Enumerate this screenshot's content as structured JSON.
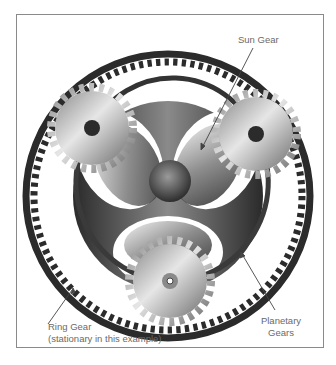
{
  "diagram": {
    "labels": {
      "sun_gear": "Sun Gear",
      "ring_gear_line1": "Ring Gear",
      "ring_gear_line2": "(stationary in this example)",
      "planetary_line1": "Planetary",
      "planetary_line2": "Gears"
    },
    "components": [
      {
        "name": "ring-gear",
        "role": "outer internal-toothed gear",
        "state": "stationary"
      },
      {
        "name": "carrier",
        "role": "tri-lobed carrier plate linking planet centres"
      },
      {
        "name": "sun-gear",
        "role": "central gear"
      },
      {
        "name": "planet-gear",
        "count": 3
      }
    ],
    "colors": {
      "ring": "#2b2b2b",
      "carrier": "#3a3a3a",
      "planet_light": "#d9d9d9",
      "planet_dark": "#7a7a7a",
      "label_text": "#6a6a6a",
      "leader_line": "#444444",
      "frame_border": "#8a8a8a"
    }
  }
}
